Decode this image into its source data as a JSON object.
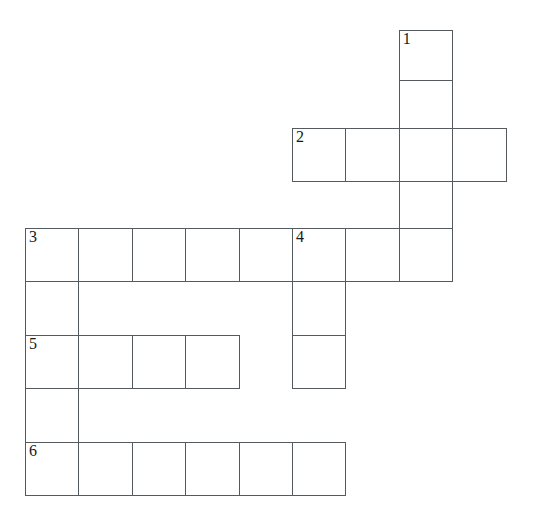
{
  "puzzle": {
    "title": "Crossword Grid",
    "type": "crossword-grid",
    "background_color": "#ffffff",
    "cell_border_color": "#555a5e",
    "number_color": "#16181a",
    "cell_size": 53.4,
    "origin_x": 25,
    "origin_y": 30,
    "columns": 9,
    "rows": 9
  },
  "grid": {
    "column_x": [
      25,
      78.4,
      131.8,
      185.2,
      238.6,
      292,
      345.4,
      398.8,
      452.2
    ],
    "row_y": [
      30,
      80,
      128,
      181,
      228,
      281.4,
      334.8,
      388.2,
      441.6
    ],
    "row_heights": [
      50,
      48,
      53,
      47,
      53.4,
      53.4,
      53.4,
      53.4,
      53.4
    ],
    "cells": [
      {
        "row": 0,
        "col": 7,
        "number": "1",
        "letter": ""
      },
      {
        "row": 1,
        "col": 7,
        "number": "",
        "letter": ""
      },
      {
        "row": 2,
        "col": 5,
        "number": "2",
        "letter": ""
      },
      {
        "row": 2,
        "col": 6,
        "number": "",
        "letter": ""
      },
      {
        "row": 2,
        "col": 7,
        "number": "",
        "letter": ""
      },
      {
        "row": 2,
        "col": 8,
        "number": "",
        "letter": ""
      },
      {
        "row": 3,
        "col": 7,
        "number": "",
        "letter": ""
      },
      {
        "row": 4,
        "col": 0,
        "number": "3",
        "letter": ""
      },
      {
        "row": 4,
        "col": 1,
        "number": "",
        "letter": ""
      },
      {
        "row": 4,
        "col": 2,
        "number": "",
        "letter": ""
      },
      {
        "row": 4,
        "col": 3,
        "number": "",
        "letter": ""
      },
      {
        "row": 4,
        "col": 4,
        "number": "",
        "letter": ""
      },
      {
        "row": 4,
        "col": 5,
        "number": "4",
        "letter": ""
      },
      {
        "row": 4,
        "col": 6,
        "number": "",
        "letter": ""
      },
      {
        "row": 4,
        "col": 7,
        "number": "",
        "letter": ""
      },
      {
        "row": 5,
        "col": 0,
        "number": "",
        "letter": ""
      },
      {
        "row": 5,
        "col": 5,
        "number": "",
        "letter": ""
      },
      {
        "row": 6,
        "col": 0,
        "number": "5",
        "letter": ""
      },
      {
        "row": 6,
        "col": 1,
        "number": "",
        "letter": ""
      },
      {
        "row": 6,
        "col": 2,
        "number": "",
        "letter": ""
      },
      {
        "row": 6,
        "col": 3,
        "number": "",
        "letter": ""
      },
      {
        "row": 6,
        "col": 5,
        "number": "",
        "letter": ""
      },
      {
        "row": 7,
        "col": 0,
        "number": "",
        "letter": ""
      },
      {
        "row": 8,
        "col": 0,
        "number": "6",
        "letter": ""
      },
      {
        "row": 8,
        "col": 1,
        "number": "",
        "letter": ""
      },
      {
        "row": 8,
        "col": 2,
        "number": "",
        "letter": ""
      },
      {
        "row": 8,
        "col": 3,
        "number": "",
        "letter": ""
      },
      {
        "row": 8,
        "col": 4,
        "number": "",
        "letter": ""
      },
      {
        "row": 8,
        "col": 5,
        "number": "",
        "letter": ""
      }
    ],
    "numbered_entries": [
      "1",
      "2",
      "3",
      "4",
      "5",
      "6"
    ]
  }
}
